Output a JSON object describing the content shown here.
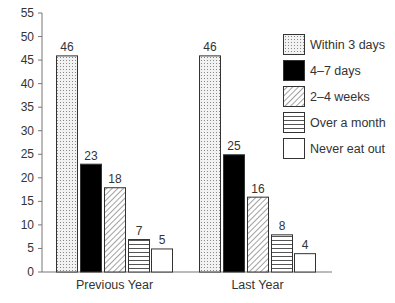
{
  "chart_data": {
    "type": "bar",
    "title": "",
    "xlabel": "",
    "ylabel": "",
    "ylim": [
      0,
      55
    ],
    "yticks": [
      0,
      5,
      10,
      15,
      20,
      25,
      30,
      35,
      40,
      45,
      50,
      55
    ],
    "grid": false,
    "legend_position": "right",
    "categories": [
      "Previous Year",
      "Last Year"
    ],
    "series": [
      {
        "name": "Within 3 days",
        "pattern": "dots",
        "values": [
          46,
          46
        ]
      },
      {
        "name": "4–7 days",
        "pattern": "solid-black",
        "values": [
          23,
          25
        ]
      },
      {
        "name": "2–4 weeks",
        "pattern": "diagonal-hatch",
        "values": [
          18,
          16
        ]
      },
      {
        "name": "Over a month",
        "pattern": "horizontal-lines",
        "values": [
          7,
          8
        ]
      },
      {
        "name": "Never eat out",
        "pattern": "white",
        "values": [
          5,
          4
        ]
      }
    ],
    "colors": {
      "stroke": "#333333",
      "solid": "#000000",
      "background": "#ffffff"
    }
  }
}
